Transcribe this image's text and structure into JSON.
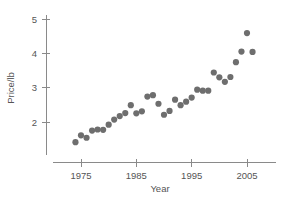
{
  "chart_data": {
    "type": "scatter",
    "title": "",
    "xlabel": "Year",
    "ylabel": "Price/lb",
    "xlim": [
      1972,
      2008
    ],
    "ylim": [
      1.1,
      5.3
    ],
    "xticks": [
      1975,
      1985,
      1995,
      2005
    ],
    "xtick_labels": [
      "1975",
      "1985",
      "1995",
      "2005"
    ],
    "yticks": [
      2,
      3,
      4,
      5
    ],
    "ytick_labels": [
      "2",
      "3",
      "4",
      "5"
    ],
    "grid": false,
    "legend": null,
    "marker": {
      "shape": "circle",
      "color": "#6e6e6e",
      "size": 3.1
    },
    "points": [
      {
        "year": 1974,
        "price": 1.42
      },
      {
        "year": 1975,
        "price": 1.62
      },
      {
        "year": 1976,
        "price": 1.55
      },
      {
        "year": 1977,
        "price": 1.76
      },
      {
        "year": 1978,
        "price": 1.79
      },
      {
        "year": 1979,
        "price": 1.78
      },
      {
        "year": 1980,
        "price": 1.93
      },
      {
        "year": 1981,
        "price": 2.08
      },
      {
        "year": 1982,
        "price": 2.18
      },
      {
        "year": 1983,
        "price": 2.27
      },
      {
        "year": 1984,
        "price": 2.5
      },
      {
        "year": 1985,
        "price": 2.26
      },
      {
        "year": 1986,
        "price": 2.32
      },
      {
        "year": 1987,
        "price": 2.75
      },
      {
        "year": 1988,
        "price": 2.79
      },
      {
        "year": 1989,
        "price": 2.54
      },
      {
        "year": 1990,
        "price": 2.22
      },
      {
        "year": 1991,
        "price": 2.33
      },
      {
        "year": 1992,
        "price": 2.66
      },
      {
        "year": 1993,
        "price": 2.5
      },
      {
        "year": 1994,
        "price": 2.6
      },
      {
        "year": 1995,
        "price": 2.72
      },
      {
        "year": 1996,
        "price": 2.95
      },
      {
        "year": 1997,
        "price": 2.92
      },
      {
        "year": 1998,
        "price": 2.92
      },
      {
        "year": 1999,
        "price": 3.45
      },
      {
        "year": 2000,
        "price": 3.31
      },
      {
        "year": 2001,
        "price": 3.18
      },
      {
        "year": 2002,
        "price": 3.32
      },
      {
        "year": 2003,
        "price": 3.75
      },
      {
        "year": 2004,
        "price": 4.06
      },
      {
        "year": 2005,
        "price": 4.6
      },
      {
        "year": 2006,
        "price": 4.05
      }
    ]
  }
}
